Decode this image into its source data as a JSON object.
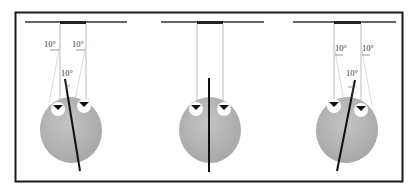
{
  "figure": {
    "colors": {
      "frame": "#1a1a1a",
      "bar": "#333333",
      "string": "#999999",
      "head": "#b3b3b3",
      "eye_white": "#ffffff",
      "pupil": "#111111",
      "axis_line": "#111111",
      "angle_guide": "#c8c8c8"
    },
    "panels": [
      {
        "id": "left",
        "head_tilt_deg": -10,
        "string_tilt_deg": -10,
        "labels": {
          "left_string_angle": "10°",
          "right_string_angle": "10°",
          "head_angle": "10°"
        }
      },
      {
        "id": "center",
        "head_tilt_deg": 0,
        "string_tilt_deg": 0,
        "labels": {}
      },
      {
        "id": "right",
        "head_tilt_deg": 10,
        "string_tilt_deg": 10,
        "labels": {
          "left_string_angle": "10°",
          "right_string_angle": "10°",
          "head_angle": "10°"
        }
      }
    ]
  }
}
